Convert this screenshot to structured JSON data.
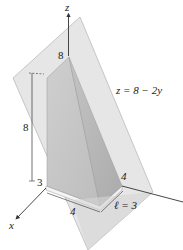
{
  "figure": {
    "type": "3d-solid-diagram",
    "axes": {
      "z_label": "z",
      "x_label": "x",
      "y_label": ""
    },
    "plane_equation": "z = 8 − 2y",
    "labels": {
      "z_top_value": "8",
      "height_dim": "8",
      "corner_value": "3",
      "front_width": "4",
      "y_extent": "4",
      "length_dim": "ℓ = 3"
    },
    "colors": {
      "plane_fill": "#dcdcdc",
      "plane_edge": "#a0a0a0",
      "solid_left_face": "#c2c2c2",
      "solid_right_face": "#b4b4b4",
      "solid_base": "#f2f2f2",
      "axis": "#333333",
      "background": "#ffffff"
    }
  }
}
